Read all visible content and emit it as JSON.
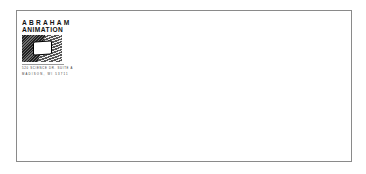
{
  "envelope": {
    "border_color": "#8a8a8a",
    "return_address": {
      "company_line1": "ABRAHAM",
      "company_line2": "ANIMATION",
      "logo_icon": "television-icon",
      "address_line1": "520 SCIENCE DR. SUITE A",
      "address_line2": "MADISON, WI 53711"
    }
  }
}
